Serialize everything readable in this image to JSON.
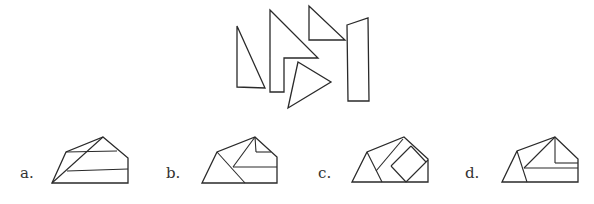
{
  "puzzle": {
    "pieces": [
      {
        "name": "tall-right-triangle",
        "points": "237,26 237,87 265,88"
      },
      {
        "name": "notched-triangle",
        "points": "270,10 318,58 284,58 284,92 270,92"
      },
      {
        "name": "small-right-triangle",
        "points": "309,6 309,40 345,40"
      },
      {
        "name": "tilted-triangle",
        "points": "298,62 288,108 331,82"
      },
      {
        "name": "long-rectangle",
        "points": "347,25 368,18 369,101 348,101"
      }
    ],
    "options": [
      {
        "label": "a.",
        "label_x": 20,
        "outline": "52,183 66,152 103,137 128,158 128,183",
        "lines": [
          [
            66,
            152,
            117,
            151
          ],
          [
            67,
            171,
            128,
            169
          ],
          [
            52,
            183,
            103,
            137
          ]
        ]
      },
      {
        "label": "b.",
        "label_x": 166,
        "outline": "202,183 217,152 255,137 277,157 277,183",
        "lines": [
          [
            255,
            137,
            256,
            152
          ],
          [
            256,
            152,
            271,
            152
          ],
          [
            233,
            167,
            277,
            167
          ],
          [
            255,
            137,
            233,
            167
          ],
          [
            217,
            152,
            245,
            183
          ]
        ]
      },
      {
        "label": "c.",
        "label_x": 318,
        "outline": "352,182 367,152 404,137 428,159 428,182",
        "lines": [
          [
            367,
            152,
            382,
            182
          ],
          [
            376,
            171,
            403,
            139
          ],
          [
            391,
            166,
            411,
            146
          ],
          [
            411,
            146,
            426,
            162
          ],
          [
            391,
            166,
            406,
            182
          ],
          [
            406,
            182,
            428,
            160
          ]
        ]
      },
      {
        "label": "d.",
        "label_x": 465,
        "outline": "502,182 517,151 555,137 578,159 578,182",
        "lines": [
          [
            555,
            137,
            555,
            163
          ],
          [
            555,
            163,
            578,
            163
          ],
          [
            524,
            168,
            578,
            168
          ],
          [
            555,
            137,
            524,
            168
          ],
          [
            517,
            151,
            527,
            182
          ]
        ]
      }
    ]
  }
}
